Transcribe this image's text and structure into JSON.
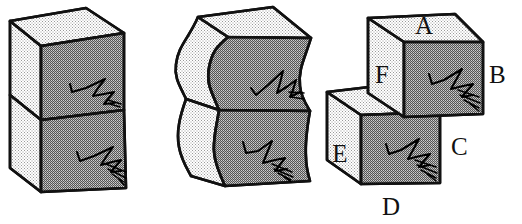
{
  "figure": {
    "background_color": "#ffffff",
    "ink_color": "#111111",
    "face_colors": {
      "light_face": "#e2e2e2",
      "mid_face": "#b5b5b5",
      "dark_face": "#a8a8a8"
    },
    "panels": [
      {
        "id": "panel-left",
        "name": "stacked-block-undeformed",
        "description": "Two cubes stacked vertically forming an upright rectangular block, drawn in oblique projection with a light-toned left face and a darker front face. A horizontal bedding line divides the block in half. Each half of the front face carries a scribbled marker squiggle."
      },
      {
        "id": "panel-middle",
        "name": "stacked-block-sheared",
        "description": "The same two stacked cubes after shear deformation, with S-curved vertical sides. The squiggles on the front faces are deformed along with the block."
      },
      {
        "id": "panel-right",
        "name": "stacked-block-offset-labeled",
        "description": "The two cubes displaced laterally along the horizontal bedding plane, with the upper cube shifted right and the lower cube shifted left. Six faces are labeled A through F."
      }
    ],
    "labels": [
      {
        "id": "label-a",
        "text": "A",
        "face": "upper-cube-top",
        "x": 424,
        "y": 34
      },
      {
        "id": "label-b",
        "text": "B",
        "face": "upper-cube-right",
        "x": 489,
        "y": 83
      },
      {
        "id": "label-f",
        "text": "F",
        "face": "upper-cube-front-left",
        "x": 382,
        "y": 83
      },
      {
        "id": "label-e",
        "text": "E",
        "face": "lower-cube-left",
        "x": 340,
        "y": 162
      },
      {
        "id": "label-c",
        "text": "C",
        "face": "lower-cube-right",
        "x": 451,
        "y": 155
      },
      {
        "id": "label-d",
        "text": "D",
        "face": "lower-cube-bottom",
        "x": 391,
        "y": 215
      }
    ]
  }
}
